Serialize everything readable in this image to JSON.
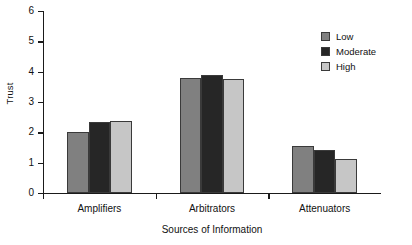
{
  "chart_data": {
    "type": "bar",
    "title": "",
    "xlabel": "Sources of Information",
    "ylabel": "Trust",
    "categories": [
      "Amplifiers",
      "Arbitrators",
      "Attenuators"
    ],
    "series": [
      {
        "name": "Low",
        "color": "#808080",
        "values": [
          2.0,
          3.79,
          1.55
        ]
      },
      {
        "name": "Moderate",
        "color": "#262626",
        "values": [
          2.33,
          3.88,
          1.42
        ]
      },
      {
        "name": "High",
        "color": "#c6c6c6",
        "values": [
          2.38,
          3.76,
          1.12
        ]
      }
    ],
    "ylim": [
      0,
      6
    ],
    "yticks": [
      "0",
      "1",
      "2",
      "3",
      "4",
      "5",
      "6"
    ],
    "grid": false,
    "legend_position": "top-right"
  },
  "axis": {
    "y_label": "Trust",
    "x_label": "Sources of Information",
    "y_ticks": [
      "6",
      "5",
      "4",
      "3",
      "2",
      "1",
      "0"
    ],
    "x_ticks": [
      "Amplifiers",
      "Arbitrators",
      "Attenuators"
    ]
  },
  "legend": {
    "items": [
      {
        "label": "Low"
      },
      {
        "label": "Moderate"
      },
      {
        "label": "High"
      }
    ]
  }
}
